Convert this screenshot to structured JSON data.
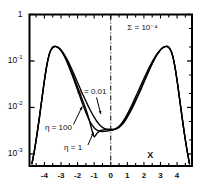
{
  "figure": {
    "axis_label_x": "X",
    "parameter_annotation": {
      "symbol": "Σ",
      "equals": "=",
      "value_mantissa": "10",
      "value_exponent": "-4"
    }
  },
  "chart_data": {
    "type": "line",
    "title": "",
    "xlabel": "X",
    "ylabel": "",
    "xlim": [
      -4.9,
      4.9
    ],
    "ylim": [
      0.0006,
      1.0
    ],
    "yscale": "log",
    "grid": false,
    "legend": "inline-annotations",
    "xticks": [
      -4.5,
      -4,
      -3.5,
      -3,
      -2.5,
      -2,
      -1.5,
      -1,
      -0.5,
      0,
      0.5,
      1,
      1.5,
      2,
      2.5,
      3,
      3.5,
      4,
      4.5
    ],
    "xtick_labels": [
      "-4",
      "-3",
      "-2",
      "-1",
      "0",
      "1",
      "2",
      "3",
      "4"
    ],
    "xtick_label_values": [
      -4,
      -3,
      -2,
      -1,
      0,
      1,
      2,
      3,
      4
    ],
    "ytick_labels": [
      "1",
      "10⁻¹",
      "10⁻²",
      "10⁻³"
    ],
    "ytick_values": [
      1,
      0.1,
      0.01,
      0.001
    ],
    "reference_line": {
      "x": 0,
      "style": "dash-dot"
    },
    "annotations": [
      {
        "text": "Σ = 10⁻⁴",
        "x": 1.0,
        "y": 0.52
      },
      {
        "text": "η = 0.01",
        "x": -1.05,
        "y": 0.021,
        "arrow_to": [
          -0.62,
          0.0068
        ]
      },
      {
        "text": "η = 100",
        "x": -3.0,
        "y": 0.0036,
        "arrow_to": [
          -1.72,
          0.0115
        ]
      },
      {
        "text": "η = 1",
        "x": -1.85,
        "y": 0.00135,
        "arrow_to": [
          -1.02,
          0.0031
        ]
      }
    ],
    "series": [
      {
        "name": "η = 0.01",
        "x": [
          -4.75,
          -4.6,
          -4.45,
          -4.3,
          -4.15,
          -4.0,
          -3.85,
          -3.7,
          -3.55,
          -3.4,
          -3.25,
          -3.1,
          -2.95,
          -2.8,
          -2.6,
          -2.4,
          -2.2,
          -2.0,
          -1.8,
          -1.6,
          -1.4,
          -1.2,
          -1.0,
          -0.8,
          -0.6,
          -0.4,
          -0.2,
          0.0,
          0.2,
          0.4,
          0.6,
          0.8,
          1.0,
          1.2,
          1.4,
          1.6,
          1.8,
          2.0,
          2.2,
          2.4,
          2.6,
          2.8,
          2.95,
          3.1,
          3.25,
          3.4,
          3.55,
          3.7,
          3.85,
          4.0,
          4.15,
          4.3,
          4.45,
          4.6,
          4.75
        ],
        "y": [
          0.00062,
          0.0012,
          0.0026,
          0.0062,
          0.0155,
          0.038,
          0.082,
          0.142,
          0.186,
          0.205,
          0.203,
          0.188,
          0.165,
          0.138,
          0.103,
          0.073,
          0.0505,
          0.0345,
          0.0235,
          0.0163,
          0.0115,
          0.0083,
          0.0062,
          0.0048,
          0.004,
          0.00355,
          0.00338,
          0.00335,
          0.00338,
          0.00355,
          0.004,
          0.0048,
          0.0062,
          0.0083,
          0.0115,
          0.0163,
          0.0235,
          0.0345,
          0.0505,
          0.073,
          0.103,
          0.138,
          0.165,
          0.188,
          0.203,
          0.205,
          0.186,
          0.142,
          0.082,
          0.038,
          0.0155,
          0.0062,
          0.0026,
          0.0012,
          0.00062
        ]
      },
      {
        "name": "η = 1",
        "x": [
          -4.75,
          -4.6,
          -4.45,
          -4.3,
          -4.15,
          -4.0,
          -3.85,
          -3.7,
          -3.55,
          -3.4,
          -3.25,
          -3.1,
          -2.95,
          -2.8,
          -2.6,
          -2.4,
          -2.2,
          -2.0,
          -1.8,
          -1.6,
          -1.4,
          -1.2,
          -1.1,
          -1.0,
          -0.9,
          -0.8,
          -0.6,
          -0.4,
          -0.2,
          0.0,
          0.2,
          0.4,
          0.6,
          0.8,
          1.0,
          1.2,
          1.4,
          1.6,
          1.8,
          2.0,
          2.2,
          2.4,
          2.6,
          2.8,
          2.95,
          3.1,
          3.25,
          3.4,
          3.55,
          3.7,
          3.85,
          4.0,
          4.15,
          4.3,
          4.45,
          4.6,
          4.75
        ],
        "y": [
          0.00062,
          0.0012,
          0.0026,
          0.0062,
          0.0155,
          0.038,
          0.082,
          0.142,
          0.186,
          0.205,
          0.202,
          0.185,
          0.16,
          0.131,
          0.094,
          0.064,
          0.0425,
          0.0276,
          0.0177,
          0.0114,
          0.0072,
          0.004,
          0.0029,
          0.00235,
          0.00255,
          0.00285,
          0.0032,
          0.00332,
          0.00336,
          0.00336,
          0.00338,
          0.0036,
          0.0041,
          0.005,
          0.0065,
          0.0089,
          0.0124,
          0.0175,
          0.0252,
          0.0365,
          0.0525,
          0.0748,
          0.104,
          0.138,
          0.164,
          0.187,
          0.202,
          0.205,
          0.186,
          0.142,
          0.082,
          0.038,
          0.0155,
          0.0062,
          0.0026,
          0.0012,
          0.00062
        ]
      },
      {
        "name": "η = 100",
        "x": [
          -4.75,
          -4.6,
          -4.45,
          -4.3,
          -4.15,
          -4.0,
          -3.85,
          -3.7,
          -3.55,
          -3.4,
          -3.25,
          -3.1,
          -2.95,
          -2.8,
          -2.6,
          -2.4,
          -2.2,
          -2.0,
          -1.8,
          -1.6,
          -1.4,
          -1.2,
          -1.0,
          -0.8,
          -0.6,
          -0.4,
          -0.2,
          0.0,
          0.2,
          0.4,
          0.6,
          0.8,
          1.0,
          1.2,
          1.4,
          1.6,
          1.8,
          2.0,
          2.2,
          2.4,
          2.6,
          2.8,
          2.95,
          3.1,
          3.25,
          3.4,
          3.55,
          3.7,
          3.85,
          4.0,
          4.15,
          4.3,
          4.45,
          4.6,
          4.75
        ],
        "y": [
          0.00062,
          0.0012,
          0.0026,
          0.0062,
          0.0155,
          0.038,
          0.082,
          0.142,
          0.186,
          0.205,
          0.201,
          0.183,
          0.156,
          0.126,
          0.0875,
          0.058,
          0.0375,
          0.0238,
          0.015,
          0.0096,
          0.0064,
          0.0046,
          0.00365,
          0.0032,
          0.00305,
          0.00305,
          0.00312,
          0.0032,
          0.00335,
          0.00368,
          0.0043,
          0.0054,
          0.0072,
          0.01,
          0.0142,
          0.0203,
          0.0292,
          0.042,
          0.0595,
          0.0828,
          0.111,
          0.143,
          0.167,
          0.189,
          0.203,
          0.205,
          0.186,
          0.142,
          0.082,
          0.038,
          0.0155,
          0.0062,
          0.0026,
          0.0012,
          0.00062
        ]
      }
    ]
  }
}
